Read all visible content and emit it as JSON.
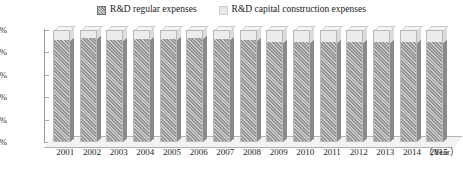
{
  "chart_data": {
    "type": "bar",
    "title": "",
    "subtitle": "",
    "stacked": true,
    "normalized_percent": true,
    "orientation": "vertical",
    "three_d": true,
    "xlabel": "（Year）",
    "ylabel": "",
    "ylim": [
      0,
      100
    ],
    "yticks": [
      "0%",
      "20%",
      "40%",
      "60%",
      "80%",
      "100%"
    ],
    "ytick_values": [
      0,
      20,
      40,
      60,
      80,
      100
    ],
    "grid": false,
    "legend_position": "top-center",
    "categories": [
      "2001",
      "2002",
      "2003",
      "2004",
      "2005",
      "2006",
      "2007",
      "2008",
      "2009",
      "2010",
      "2011",
      "2012",
      "2013",
      "2014",
      "2015"
    ],
    "series": [
      {
        "name": "R&D regular expenses",
        "color": "#9a9a9a",
        "pattern": "diagonal-hatch",
        "values": [
          90,
          92,
          90,
          91,
          91,
          92,
          91,
          90,
          88,
          88,
          88,
          88,
          88,
          88,
          88
        ]
      },
      {
        "name": "R&D capital construction expenses",
        "color": "#ececec",
        "pattern": "solid",
        "values": [
          10,
          8,
          10,
          9,
          9,
          8,
          9,
          10,
          12,
          12,
          12,
          12,
          12,
          12,
          12
        ]
      }
    ]
  },
  "legend": {
    "items": [
      {
        "label": "R&D regular expenses",
        "swatch": "dark-hatched-square"
      },
      {
        "label": "R&D capital construction expenses",
        "swatch": "light-gray-square"
      }
    ]
  },
  "axis": {
    "x_unit_label": "（Year）"
  },
  "colors": {
    "series_regular": "#9a9a9a",
    "series_capital": "#ececec",
    "axis": "#9a9a9a",
    "text": "#1d1d1d",
    "background": "#ffffff"
  }
}
